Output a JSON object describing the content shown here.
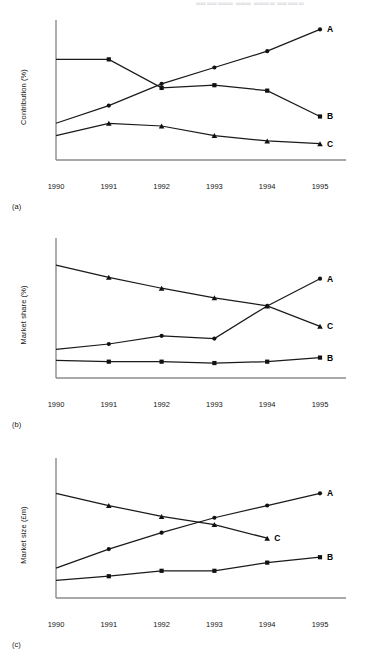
{
  "header": {
    "running_head": "▭▭▭▭▭▭▭ ▭▭▭ ▭▭▭▭ ▭▭▭▭▭"
  },
  "panels": [
    {
      "key": "a",
      "panel_label": "(a)",
      "ylabel": "Contribution (%)",
      "series_labels": {
        "A": "A",
        "B": "B",
        "C": "C"
      }
    },
    {
      "key": "b",
      "panel_label": "(b)",
      "ylabel": "Market share (%)",
      "series_labels": {
        "A": "A",
        "B": "B",
        "C": "C"
      }
    },
    {
      "key": "c",
      "panel_label": "(c)",
      "ylabel": "Market size (£m)",
      "series_labels": {
        "A": "A",
        "B": "B",
        "C": "C"
      }
    }
  ],
  "chart_data": [
    {
      "type": "line",
      "title": "",
      "panel": "(a)",
      "xlabel": "",
      "ylabel": "Contribution (%)",
      "categories": [
        "1990",
        "1991",
        "1992",
        "1993",
        "1994",
        "1995"
      ],
      "x": [
        1990,
        1991,
        1992,
        1993,
        1994,
        1995
      ],
      "xlim": [
        1990,
        1995
      ],
      "ylim": [
        0,
        100
      ],
      "grid": false,
      "legend": "inline-right-of-line-ends",
      "axis_ticks_numeric": false,
      "series": [
        {
          "name": "A",
          "marker": "circle",
          "label": "A",
          "values": [
            27,
            40,
            56,
            68,
            80,
            96
          ]
        },
        {
          "name": "B",
          "marker": "square",
          "label": "B",
          "values": [
            74,
            74,
            53,
            55,
            51,
            32
          ]
        },
        {
          "name": "C",
          "marker": "triangle",
          "label": "C",
          "values": [
            18,
            27,
            25,
            18,
            14,
            12
          ]
        }
      ]
    },
    {
      "type": "line",
      "title": "",
      "panel": "(b)",
      "xlabel": "",
      "ylabel": "Market share (%)",
      "categories": [
        "1990",
        "1991",
        "1992",
        "1993",
        "1994",
        "1995"
      ],
      "x": [
        1990,
        1991,
        1992,
        1993,
        1994,
        1995
      ],
      "xlim": [
        1990,
        1995
      ],
      "ylim": [
        0,
        100
      ],
      "grid": false,
      "legend": "inline-right-of-line-ends",
      "axis_ticks_numeric": false,
      "series": [
        {
          "name": "A",
          "marker": "circle",
          "label": "A",
          "values": [
            21,
            25,
            31,
            29,
            53,
            73
          ]
        },
        {
          "name": "B",
          "marker": "square",
          "label": "B",
          "values": [
            13,
            12,
            12,
            11,
            12,
            15
          ]
        },
        {
          "name": "C",
          "marker": "triangle",
          "label": "C",
          "values": [
            83,
            74,
            66,
            59,
            53,
            38
          ]
        }
      ]
    },
    {
      "type": "line",
      "title": "",
      "panel": "(c)",
      "xlabel": "",
      "ylabel": "Market size (£m)",
      "categories": [
        "1990",
        "1991",
        "1992",
        "1993",
        "1994",
        "1995"
      ],
      "x": [
        1990,
        1991,
        1992,
        1993,
        1994,
        1995
      ],
      "xlim": [
        1990,
        1995
      ],
      "ylim": [
        0,
        100
      ],
      "grid": false,
      "legend": "inline-right-of-line-ends",
      "axis_ticks_numeric": false,
      "series": [
        {
          "name": "A",
          "marker": "circle",
          "label": "A",
          "values": [
            22,
            36,
            48,
            59,
            68,
            77
          ]
        },
        {
          "name": "B",
          "marker": "square",
          "label": "B",
          "values": [
            13,
            16,
            20,
            20,
            26,
            30
          ]
        },
        {
          "name": "C",
          "marker": "triangle",
          "label": "C",
          "values": [
            77,
            68,
            60,
            54,
            44
          ]
        }
      ]
    }
  ],
  "axis": {
    "tick_labels": [
      "1990",
      "1991",
      "1992",
      "1993",
      "1994",
      "1995"
    ]
  }
}
